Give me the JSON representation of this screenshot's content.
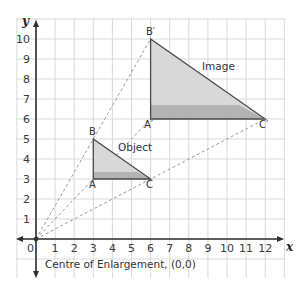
{
  "diagram": {
    "type": "enlargement",
    "axes": {
      "x_label": "x",
      "y_label": "y",
      "origin_label": "0",
      "x_ticks": [
        "1",
        "2",
        "3",
        "4",
        "5",
        "6",
        "7",
        "8",
        "9",
        "10",
        "11",
        "12"
      ],
      "y_ticks": [
        "1",
        "2",
        "3",
        "4",
        "5",
        "6",
        "7",
        "8",
        "9",
        "10"
      ]
    },
    "object": {
      "label": "Object",
      "vertices": [
        {
          "name": "A",
          "x": 3,
          "y": 3
        },
        {
          "name": "B",
          "x": 3,
          "y": 5
        },
        {
          "name": "C",
          "x": 6,
          "y": 3
        }
      ]
    },
    "image": {
      "label": "Image",
      "vertices": [
        {
          "name": "A′",
          "x": 6,
          "y": 6
        },
        {
          "name": "B′",
          "x": 6,
          "y": 10
        },
        {
          "name": "C′",
          "x": 12,
          "y": 6
        }
      ]
    },
    "caption": "Centre of Enlargement, (0,0)",
    "colors": {
      "grid": "#d9d9d9",
      "axis": "#333333",
      "fill_light": "#d6d6d6",
      "fill_dark": "#b5b5b5",
      "edge": "#4a4a4a",
      "ray": "#999999"
    }
  }
}
